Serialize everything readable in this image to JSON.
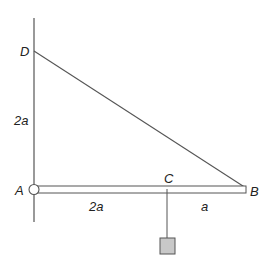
{
  "diagram": {
    "labels": {
      "D": "D",
      "A": "A",
      "B": "B",
      "C": "C",
      "wall_length": "2a",
      "AC_length": "2a",
      "CB_length": "a"
    },
    "colors": {
      "line": "#555555",
      "weight_fill": "#c8c8c8",
      "weight_stroke": "#555555",
      "background": "#ffffff"
    }
  }
}
